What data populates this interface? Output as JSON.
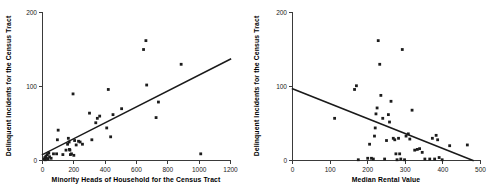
{
  "figure": {
    "background": "#ffffff",
    "marker_color": "#1c1c1c",
    "line_color": "#1a1a1a",
    "axis_color": "#3a3a3a"
  },
  "chart_data": [
    {
      "id": "left",
      "type": "scatter",
      "title": "",
      "xlabel": "Minority Heads of Household for the Census Tract",
      "ylabel": "Delinquent Incidents for the Census Tract",
      "xlim": [
        0,
        1200
      ],
      "ylim": [
        0,
        200
      ],
      "xticks": [
        0,
        200,
        400,
        600,
        800,
        1000,
        1200
      ],
      "xticklabels": [
        "0",
        "200",
        "400",
        "600",
        "800",
        "1000",
        "1200"
      ],
      "yticks": [
        0,
        100,
        200
      ],
      "yticklabels": [
        "0",
        "100",
        "200"
      ],
      "grid": false,
      "legend": "none",
      "points": [
        [
          10,
          2
        ],
        [
          15,
          4
        ],
        [
          18,
          1
        ],
        [
          22,
          6
        ],
        [
          25,
          3
        ],
        [
          30,
          8
        ],
        [
          35,
          2
        ],
        [
          40,
          10
        ],
        [
          45,
          5
        ],
        [
          55,
          3
        ],
        [
          70,
          9
        ],
        [
          90,
          9
        ],
        [
          95,
          28
        ],
        [
          100,
          41
        ],
        [
          130,
          8
        ],
        [
          150,
          14
        ],
        [
          160,
          22
        ],
        [
          165,
          30
        ],
        [
          170,
          25
        ],
        [
          172,
          15
        ],
        [
          175,
          14
        ],
        [
          178,
          8
        ],
        [
          185,
          9
        ],
        [
          195,
          90
        ],
        [
          200,
          7
        ],
        [
          205,
          27
        ],
        [
          215,
          21
        ],
        [
          230,
          26
        ],
        [
          240,
          25
        ],
        [
          255,
          22
        ],
        [
          300,
          64
        ],
        [
          315,
          28
        ],
        [
          340,
          51
        ],
        [
          350,
          57
        ],
        [
          365,
          60
        ],
        [
          410,
          44
        ],
        [
          420,
          96
        ],
        [
          435,
          32
        ],
        [
          450,
          62
        ],
        [
          505,
          70
        ],
        [
          645,
          150
        ],
        [
          660,
          162
        ],
        [
          665,
          102
        ],
        [
          725,
          58
        ],
        [
          740,
          79
        ],
        [
          885,
          130
        ],
        [
          1010,
          9
        ]
      ],
      "trendline": {
        "x": [
          0,
          1200
        ],
        "y": [
          8,
          137
        ]
      }
    },
    {
      "id": "right",
      "type": "scatter",
      "title": "",
      "xlabel": "Median Rental Value",
      "ylabel": "Delinquent Incidents for the Census Tract",
      "xlim": [
        0,
        500
      ],
      "ylim": [
        0,
        200
      ],
      "xticks": [
        0,
        100,
        200,
        300,
        400,
        500
      ],
      "xticklabels": [
        "0",
        "100",
        "200",
        "300",
        "400",
        "500"
      ],
      "yticks": [
        0,
        100,
        200
      ],
      "yticklabels": [
        "0",
        "100",
        "200"
      ],
      "grid": false,
      "legend": "none",
      "points": [
        [
          112,
          57
        ],
        [
          165,
          96
        ],
        [
          170,
          101
        ],
        [
          175,
          1
        ],
        [
          200,
          3
        ],
        [
          205,
          22
        ],
        [
          210,
          3
        ],
        [
          215,
          2
        ],
        [
          218,
          33
        ],
        [
          220,
          44
        ],
        [
          222,
          63
        ],
        [
          225,
          71
        ],
        [
          228,
          162
        ],
        [
          232,
          130
        ],
        [
          235,
          88
        ],
        [
          240,
          57
        ],
        [
          245,
          2
        ],
        [
          250,
          27
        ],
        [
          255,
          62
        ],
        [
          258,
          52
        ],
        [
          262,
          80
        ],
        [
          268,
          30
        ],
        [
          272,
          28
        ],
        [
          275,
          9
        ],
        [
          278,
          1
        ],
        [
          282,
          30
        ],
        [
          285,
          9
        ],
        [
          288,
          2
        ],
        [
          292,
          150
        ],
        [
          298,
          1
        ],
        [
          302,
          33
        ],
        [
          308,
          36
        ],
        [
          312,
          29
        ],
        [
          318,
          68
        ],
        [
          325,
          14
        ],
        [
          332,
          15
        ],
        [
          338,
          16
        ],
        [
          345,
          11
        ],
        [
          352,
          2
        ],
        [
          365,
          2
        ],
        [
          372,
          30
        ],
        [
          378,
          2
        ],
        [
          382,
          34
        ],
        [
          386,
          28
        ],
        [
          390,
          4
        ],
        [
          398,
          1
        ],
        [
          418,
          20
        ],
        [
          465,
          21
        ]
      ],
      "trendline": {
        "x": [
          0,
          480
        ],
        "y": [
          97,
          0
        ]
      }
    }
  ]
}
